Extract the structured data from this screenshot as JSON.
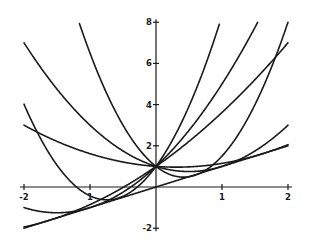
{
  "chart_data": {
    "type": "line",
    "title": "",
    "xlabel": "",
    "ylabel": "",
    "xlim": [
      -2,
      2
    ],
    "ylim": [
      -2,
      8
    ],
    "grid": false,
    "legend": null,
    "x_ticks": [
      {
        "value": -2,
        "label": "-2"
      },
      {
        "value": -1,
        "label": "1"
      },
      {
        "value": 1,
        "label": "1"
      },
      {
        "value": 2,
        "label": "2"
      }
    ],
    "y_ticks": [
      {
        "value": 8,
        "label": "8"
      },
      {
        "value": 6,
        "label": "6"
      },
      {
        "value": 4,
        "label": "4"
      },
      {
        "value": 2,
        "label": "2"
      },
      {
        "value": -2,
        "label": "-2"
      }
    ],
    "annotations": [],
    "series": [
      {
        "name": "parabola-1",
        "kind": "quadratic",
        "coeffs": [
          2.94,
          4.37,
          1
        ],
        "note": "y = 2.94x^2 + 4.37x + 1; from (-2,4), min near (-0.74,-0.62), reaches 8 near x=0.97"
      },
      {
        "name": "parabola-2",
        "kind": "quadratic",
        "coeffs": [
          1,
          -1,
          1
        ],
        "note": "y = x^2 - x + 1; from (-2,7) to (2,3)"
      },
      {
        "name": "parabola-3",
        "kind": "quadratic",
        "coeffs": [
          3,
          -2.5,
          1
        ],
        "note": "y = 3x^2 - 2.5x + 1; reaches 8 near x=-1.17 and x=2"
      },
      {
        "name": "parabola-4",
        "kind": "quadratic",
        "coeffs": [
          0.382,
          -0.236,
          1
        ],
        "note": "y = 0.382x^2 - 0.236x + 1; from (-2,3) to (2,2.06)"
      },
      {
        "name": "parabola-5",
        "kind": "quadratic",
        "coeffs": [
          1,
          3,
          1
        ],
        "note": "y = x^2 + 3x + 1; from (-2,-1), min (-1.5,-1.25), reaches 8 near x=1.54"
      },
      {
        "name": "parabola-6",
        "kind": "quadratic",
        "coeffs": [
          0.382,
          2.236,
          1
        ],
        "note": "y = 0.382x^2 + 2.236x + 1; from (-2,-1.94) to (2,7)"
      },
      {
        "name": "tangent-line",
        "kind": "quadratic",
        "coeffs": [
          0,
          1,
          0
        ],
        "note": "y = x; envelope line from (-2,-2) to (2,2)"
      }
    ],
    "common_point": {
      "x": 0,
      "y": 1
    }
  },
  "layout": {
    "origin_px": [
      156,
      187
    ],
    "x_scale_px": 66,
    "y_scale_px": 20.6
  }
}
